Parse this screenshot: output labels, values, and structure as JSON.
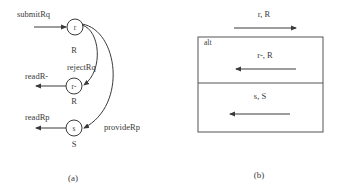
{
  "panel_a": {
    "caption": "(a)",
    "states": [
      {
        "id": "r",
        "label": "r",
        "sublabel": "R"
      },
      {
        "id": "r-",
        "label": "r-",
        "sublabel": "R"
      },
      {
        "id": "s",
        "label": "s",
        "sublabel": "S"
      }
    ],
    "transitions": {
      "submit": "submitRq",
      "reject": "rejectRq",
      "provide": "provideRp",
      "read_r_minus": "readR-",
      "read_rp": "readRp"
    }
  },
  "panel_b": {
    "caption": "(b)",
    "fragment_label": "alt",
    "messages": [
      {
        "label": "r, R",
        "direction": "right"
      },
      {
        "label": "r-, R",
        "direction": "left"
      },
      {
        "label": "s, S",
        "direction": "left"
      }
    ]
  },
  "colors": {
    "stroke": "#3a3a3a",
    "box": "#555555",
    "background": "#ffffff"
  }
}
